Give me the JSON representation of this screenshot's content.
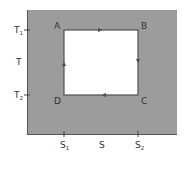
{
  "diagram": {
    "type": "T-S diagram (Carnot cycle)",
    "colors": {
      "background": "#ffffff",
      "plot_area": "#9c9c9c",
      "cycle_fill": "#ffffff",
      "cycle_stroke": "#505050",
      "axis": "#555555",
      "text": "#333333"
    },
    "y_axis": {
      "label": "T",
      "ticks": [
        {
          "main": "T",
          "sub": "1",
          "position": "top"
        },
        {
          "main": "T",
          "sub": "2",
          "position": "bottom"
        }
      ]
    },
    "x_axis": {
      "label": "S",
      "ticks": [
        {
          "main": "S",
          "sub": "1",
          "position": "left"
        },
        {
          "main": "S",
          "sub": "2",
          "position": "right"
        }
      ]
    },
    "corners": {
      "A": "A",
      "B": "B",
      "C": "C",
      "D": "D"
    },
    "path_direction": [
      "A→B",
      "B→C",
      "C→D",
      "D→A"
    ]
  }
}
